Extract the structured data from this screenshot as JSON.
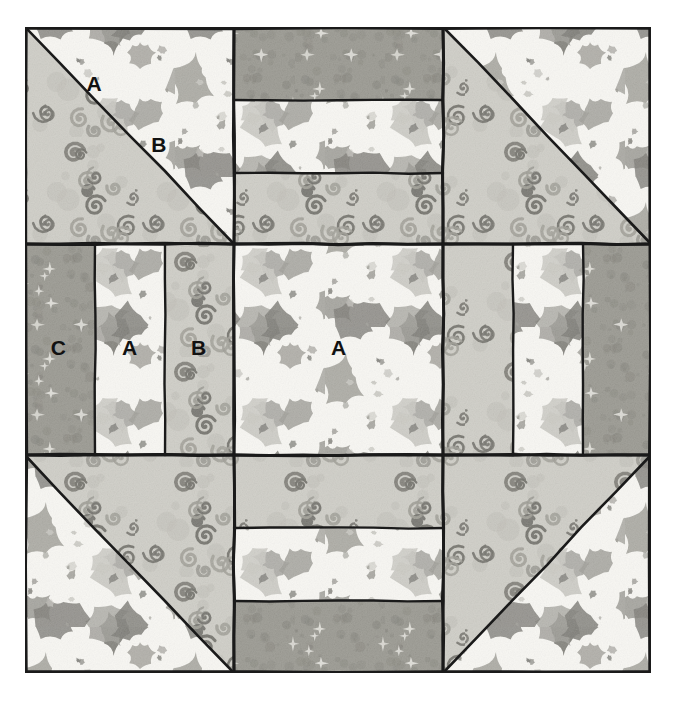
{
  "diagram": {
    "kind": "quilt-block-piecing-diagram",
    "background": "#ffffff",
    "outline_color": "#1a1a1a",
    "block": {
      "x": 25,
      "y": 27,
      "width": 626,
      "height": 646
    }
  },
  "fabrics": [
    {
      "code": "A",
      "name": "light-blob-print",
      "base": "#f7f6f2",
      "motif_light": "#c9c8c2",
      "motif_mid": "#9e9d96",
      "motif_dark": "#7b7a74",
      "description": "near-white background scattered with soft grey blob / animal shapes"
    },
    {
      "code": "B",
      "name": "swirl-print",
      "base": "#cdccc5",
      "motif_light": "#bebdb5",
      "motif_mid": "#9d9c94",
      "motif_dark": "#6f6e67",
      "description": "medium grey background covered in small spiral / swirl rings"
    },
    {
      "code": "C",
      "name": "dark-star-print",
      "base": "#97968e",
      "motif_light": "#e3e2dc",
      "motif_mid": "#86857d",
      "motif_dark": "#7d7c74",
      "description": "darker mottled grey with small light star bursts"
    }
  ],
  "grid": {
    "columns": 3,
    "rows": 3,
    "column_edges": [
      0,
      209,
      418,
      626
    ],
    "row_edges": [
      0,
      217,
      428,
      646
    ]
  },
  "units": [
    {
      "id": "top-left",
      "type": "half-square-triangle",
      "row": 1,
      "column": 1,
      "diagonal": "tl-br",
      "upper_fabric": "A",
      "lower_fabric": "B",
      "labels": [
        {
          "text": "A",
          "x": 0.33,
          "y": 0.27
        },
        {
          "text": "B",
          "x": 0.64,
          "y": 0.55
        }
      ]
    },
    {
      "id": "top-center",
      "type": "three-horizontal-strips",
      "row": 1,
      "column": 2,
      "strips": [
        "C",
        "A",
        "B"
      ],
      "labels": []
    },
    {
      "id": "top-right",
      "type": "half-square-triangle",
      "row": 1,
      "column": 3,
      "diagonal": "tl-br",
      "upper_fabric": "A",
      "lower_fabric": "B",
      "labels": []
    },
    {
      "id": "middle-left",
      "type": "three-vertical-strips",
      "row": 2,
      "column": 1,
      "strips": [
        "C",
        "A",
        "B"
      ],
      "labels": [
        {
          "text": "C",
          "x": 0.16,
          "y": 0.5
        },
        {
          "text": "A",
          "x": 0.5,
          "y": 0.5
        },
        {
          "text": "B",
          "x": 0.83,
          "y": 0.5
        }
      ]
    },
    {
      "id": "center",
      "type": "plain-square",
      "row": 2,
      "column": 2,
      "fabric": "A",
      "labels": [
        {
          "text": "A",
          "x": 0.5,
          "y": 0.5
        }
      ]
    },
    {
      "id": "middle-right",
      "type": "three-vertical-strips",
      "row": 2,
      "column": 3,
      "strips": [
        "B",
        "A",
        "C"
      ],
      "labels": []
    },
    {
      "id": "bottom-left",
      "type": "half-square-triangle",
      "row": 3,
      "column": 1,
      "diagonal": "tl-br",
      "upper_fabric": "B",
      "lower_fabric": "A",
      "labels": []
    },
    {
      "id": "bottom-center",
      "type": "three-horizontal-strips",
      "row": 3,
      "column": 2,
      "strips": [
        "B",
        "A",
        "C"
      ],
      "labels": []
    },
    {
      "id": "bottom-right",
      "type": "half-square-triangle",
      "row": 3,
      "column": 3,
      "diagonal": "bl-tr",
      "upper_fabric": "B",
      "lower_fabric": "A",
      "labels": []
    }
  ],
  "legend": {
    "a_label": "A",
    "b_label": "B",
    "c_label": "C"
  }
}
